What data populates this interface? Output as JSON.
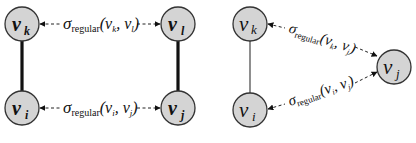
{
  "diagrams": [
    {
      "id": "left",
      "style": "bold",
      "nodes": [
        {
          "id": "vk",
          "base": "v",
          "sub": "k",
          "cx": 22,
          "cy": 24
        },
        {
          "id": "vl",
          "base": "v",
          "sub": "l",
          "cx": 178,
          "cy": 24
        },
        {
          "id": "vi",
          "base": "v",
          "sub": "i",
          "cx": 22,
          "cy": 108
        },
        {
          "id": "vj",
          "base": "v",
          "sub": "j",
          "cx": 178,
          "cy": 108
        }
      ],
      "solid_edges": [
        {
          "from": "vk",
          "to": "vi"
        },
        {
          "from": "vl",
          "to": "vj"
        }
      ],
      "dashed_edges": [
        {
          "from": "vk",
          "to": "vl",
          "label_sigma": "σ",
          "label_sub": "regular",
          "label_args": "(v",
          "arg1": "k",
          "arg2": "l"
        },
        {
          "from": "vi",
          "to": "vj",
          "label_sigma": "σ",
          "label_sub": "regular",
          "label_args": "(v",
          "arg1": "i",
          "arg2": "j"
        }
      ]
    },
    {
      "id": "right",
      "style": "regular",
      "nodes": [
        {
          "id": "vk",
          "base": "v",
          "sub": "k",
          "cx": 250,
          "cy": 24
        },
        {
          "id": "vi",
          "base": "v",
          "sub": "i",
          "cx": 250,
          "cy": 110
        },
        {
          "id": "vj",
          "base": "v",
          "sub": "j",
          "cx": 394,
          "cy": 67
        }
      ],
      "solid_edges": [
        {
          "from": "vk",
          "to": "vi"
        }
      ],
      "dashed_edges": [
        {
          "from": "vk",
          "to": "vj",
          "label_sigma": "σ",
          "label_sub": "regular",
          "arg1": "k",
          "arg2": "j"
        },
        {
          "from": "vi",
          "to": "vj",
          "label_sigma": "σ",
          "label_sub": "regular",
          "arg1": "i",
          "arg2": "j"
        }
      ]
    }
  ],
  "colors": {
    "node_fill": "#d4d4d4",
    "node_stroke": "#333333",
    "edge": "#111111",
    "background": "#ffffff"
  }
}
